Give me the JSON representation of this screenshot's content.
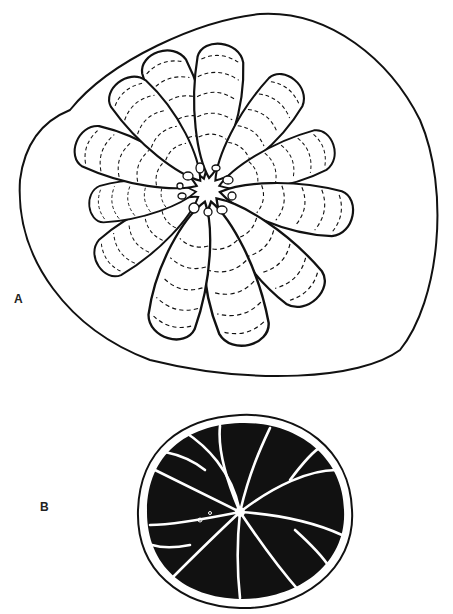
{
  "figure": {
    "panels": [
      {
        "label": "A",
        "label_x": 14,
        "label_y": 300,
        "description": "Cross-section outline with radiating lobed segments and dashed growth lines"
      },
      {
        "label": "B",
        "label_x": 40,
        "label_y": 497,
        "description": "Solid black radial disc with white branching septa"
      }
    ]
  },
  "colors": {
    "ink": "#111111",
    "paper": "#ffffff"
  }
}
